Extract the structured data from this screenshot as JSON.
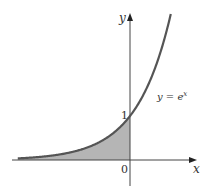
{
  "chart_data": {
    "type": "area",
    "title": "",
    "function": "y = e^x",
    "curve_label": "y = e",
    "curve_label_exp": "x",
    "xlabel": "x",
    "ylabel": "y",
    "ticks": {
      "origin": "0",
      "y_intercept": "1"
    },
    "shaded_region": {
      "from_x": "-inf",
      "to_x": 0,
      "description": "area under y = e^x for x ≤ 0"
    },
    "x_range": [
      -3.3,
      1.2
    ],
    "y_range": [
      -0.6,
      3.3
    ],
    "points": [
      {
        "x": -3.3,
        "y": 0.037
      },
      {
        "x": -3,
        "y": 0.05
      },
      {
        "x": -2.5,
        "y": 0.082
      },
      {
        "x": -2,
        "y": 0.135
      },
      {
        "x": -1.5,
        "y": 0.223
      },
      {
        "x": -1,
        "y": 0.368
      },
      {
        "x": -0.5,
        "y": 0.607
      },
      {
        "x": 0,
        "y": 1
      },
      {
        "x": 0.5,
        "y": 1.649
      },
      {
        "x": 1,
        "y": 2.718
      },
      {
        "x": 1.19,
        "y": 3.29
      }
    ],
    "colors": {
      "curve": "#555555",
      "fill": "#b3b3b3",
      "axis": "#444444"
    }
  },
  "labels": {
    "x_axis": "x",
    "y_axis": "y",
    "origin": "0",
    "one": "1",
    "curve_main": "y = e",
    "curve_exp": "x"
  }
}
